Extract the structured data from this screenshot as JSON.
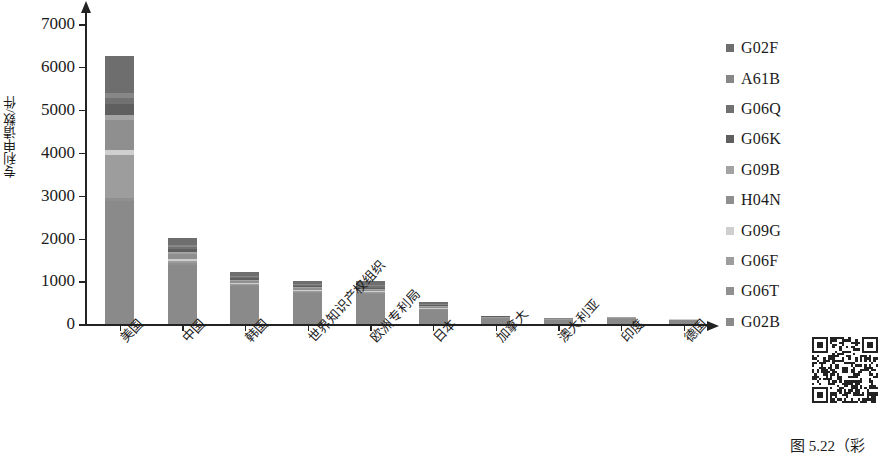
{
  "figure": {
    "caption": "图 5.22（彩",
    "qr_alt": "qr-code"
  },
  "chart_data": {
    "type": "bar",
    "subtype": "stacked-bar",
    "title": "",
    "xlabel": "",
    "ylabel": "专利申请数/件",
    "ylim": [
      0,
      7000
    ],
    "ytick_step": 1000,
    "yticks": [
      0,
      1000,
      2000,
      3000,
      4000,
      5000,
      6000,
      7000
    ],
    "ytick_labels": [
      "0",
      "1000",
      "2000",
      "3000",
      "4000",
      "5000",
      "6000",
      "7000"
    ],
    "grid": false,
    "legend_position": "right",
    "categories": [
      "美国",
      "中国",
      "韩国",
      "世界知识产权组织",
      "欧洲专利局",
      "日本",
      "加拿大",
      "澳大利亚",
      "印度",
      "德国"
    ],
    "totals": [
      6250,
      2020,
      1210,
      1000,
      1020,
      530,
      200,
      140,
      180,
      130
    ],
    "series": [
      {
        "name": "G02B",
        "color": "#8a8a8a",
        "values": [
          2880,
          1390,
          900,
          740,
          700,
          330,
          150,
          105,
          130,
          100
        ]
      },
      {
        "name": "G06T",
        "color": "#909090",
        "values": [
          70,
          30,
          20,
          20,
          20,
          15,
          5,
          4,
          5,
          4
        ]
      },
      {
        "name": "G06F",
        "color": "#9d9d9d",
        "values": [
          1010,
          60,
          30,
          25,
          25,
          20,
          8,
          5,
          8,
          5
        ]
      },
      {
        "name": "G09G",
        "color": "#cfcfcf",
        "values": [
          110,
          40,
          20,
          20,
          20,
          15,
          5,
          4,
          5,
          4
        ]
      },
      {
        "name": "H04N",
        "color": "#8f8f8f",
        "values": [
          700,
          110,
          35,
          30,
          30,
          20,
          7,
          4,
          7,
          4
        ]
      },
      {
        "name": "G09B",
        "color": "#a3a3a3",
        "values": [
          120,
          60,
          25,
          25,
          25,
          15,
          5,
          4,
          5,
          3
        ]
      },
      {
        "name": "G06K",
        "color": "#5f5f5f",
        "values": [
          250,
          70,
          40,
          35,
          35,
          25,
          6,
          4,
          6,
          3
        ]
      },
      {
        "name": "G06Q",
        "color": "#717171",
        "values": [
          150,
          50,
          30,
          25,
          30,
          20,
          5,
          3,
          5,
          3
        ]
      },
      {
        "name": "A61B",
        "color": "#878787",
        "values": [
          110,
          45,
          25,
          25,
          25,
          20,
          5,
          3,
          5,
          2
        ]
      },
      {
        "name": "G02F",
        "color": "#6e6e6e",
        "values": [
          850,
          165,
          85,
          55,
          110,
          50,
          4,
          4,
          4,
          2
        ]
      }
    ],
    "legend_entries": [
      {
        "label": "G02F",
        "color": "#6e6e6e"
      },
      {
        "label": "A61B",
        "color": "#878787"
      },
      {
        "label": "G06Q",
        "color": "#717171"
      },
      {
        "label": "G06K",
        "color": "#5f5f5f"
      },
      {
        "label": "G09B",
        "color": "#a3a3a3"
      },
      {
        "label": "H04N",
        "color": "#8f8f8f"
      },
      {
        "label": "G09G",
        "color": "#cfcfcf"
      },
      {
        "label": "G06F",
        "color": "#9d9d9d"
      },
      {
        "label": "G06T",
        "color": "#909090"
      },
      {
        "label": "G02B",
        "color": "#8a8a8a"
      }
    ]
  }
}
